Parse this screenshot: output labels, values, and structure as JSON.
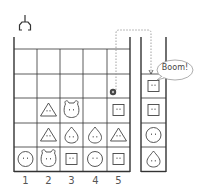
{
  "diagram": {
    "title": "",
    "claw": {
      "icon": "claw-icon",
      "column": 1
    },
    "columns": [
      "1",
      "2",
      "3",
      "4",
      "5"
    ],
    "grid": {
      "rows": 5,
      "cols": 5,
      "cells": [
        [
          "",
          "",
          "",
          "",
          ""
        ],
        [
          "",
          "",
          "",
          "",
          ""
        ],
        [
          "",
          "triangle",
          "bear",
          "",
          "square"
        ],
        [
          "",
          "triangle",
          "drop",
          "drop",
          "triangle"
        ],
        [
          "smiley",
          "bear",
          "square",
          "smiley",
          "square"
        ]
      ]
    },
    "marker": {
      "label": "4",
      "column": 5,
      "row": 2
    },
    "side_tube": {
      "items": [
        "square",
        "square",
        "smiley",
        "drop"
      ]
    },
    "speech_bubble": {
      "text": "Boom!"
    },
    "colors": {
      "line": "#333333",
      "dotted": "#999999",
      "marker": "#444444"
    }
  }
}
